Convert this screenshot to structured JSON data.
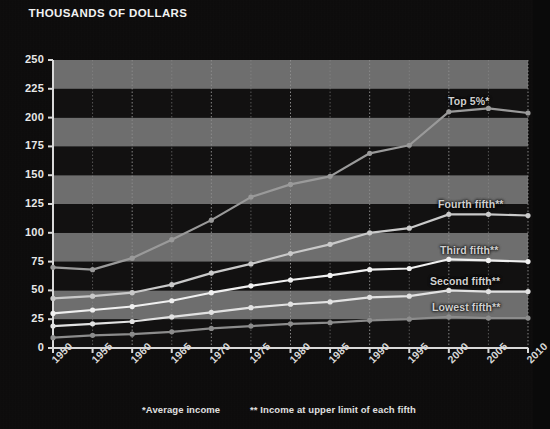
{
  "title": "THOUSANDS OF DOLLARS",
  "footnotes": {
    "average": "*Average income",
    "upper_limit": "** Income at upper limit of each fifth"
  },
  "colors": {
    "background": "#0d0c0c",
    "band_light": "#6e6e6e",
    "band_dark": "#121111",
    "axis": "#d9d9d9",
    "gridline": "#8e8e8e",
    "text": "#eaeaea",
    "series_top5": "#9a9a9a",
    "series_fourth": "#c9c9c9",
    "series_third": "#f0f0f0",
    "series_second": "#e2e2e2",
    "series_lowest": "#8c8c8c"
  },
  "chart_data": {
    "type": "line",
    "title": "THOUSANDS OF DOLLARS",
    "xlabel": "",
    "ylabel": "THOUSANDS OF DOLLARS",
    "xlim": [
      1950,
      2010
    ],
    "ylim": [
      0,
      250
    ],
    "ytick_step": 25,
    "grid": true,
    "legend_position": "inline-right",
    "x": [
      1950,
      1955,
      1960,
      1965,
      1970,
      1975,
      1980,
      1985,
      1990,
      1995,
      2000,
      2005,
      2010
    ],
    "xtick_labels": [
      "1950",
      "1955",
      "1960",
      "1965",
      "1970",
      "1975",
      "1980",
      "1985",
      "1990",
      "1995",
      "2000",
      "2005",
      "2010"
    ],
    "ytick_labels": [
      "0",
      "25",
      "50",
      "75",
      "100",
      "125",
      "150",
      "175",
      "200",
      "225",
      "250"
    ],
    "series": [
      {
        "name": "Top 5%*",
        "label": "Top 5%*",
        "color": "#9a9a9a",
        "values": [
          70,
          68,
          78,
          94,
          111,
          131,
          142,
          149,
          169,
          176,
          205,
          208,
          204
        ]
      },
      {
        "name": "Fourth fifth**",
        "label": "Fourth fifth**",
        "color": "#c9c9c9",
        "values": [
          43,
          45,
          48,
          55,
          65,
          73,
          82,
          90,
          100,
          104,
          116,
          116,
          115
        ]
      },
      {
        "name": "Third fifth**",
        "label": "Third fifth**",
        "color": "#f0f0f0",
        "values": [
          30,
          33,
          36,
          41,
          48,
          54,
          59,
          63,
          68,
          69,
          77,
          76,
          75
        ]
      },
      {
        "name": "Second fifth**",
        "label": "Second fifth**",
        "color": "#e2e2e2",
        "values": [
          19,
          21,
          23,
          27,
          31,
          35,
          38,
          40,
          44,
          45,
          50,
          49,
          49
        ]
      },
      {
        "name": "Lowest fifth**",
        "label": "Lowest fifth**",
        "color": "#8c8c8c",
        "values": [
          9,
          11,
          12,
          14,
          17,
          19,
          21,
          22,
          24,
          25,
          27,
          26,
          26
        ]
      }
    ]
  }
}
